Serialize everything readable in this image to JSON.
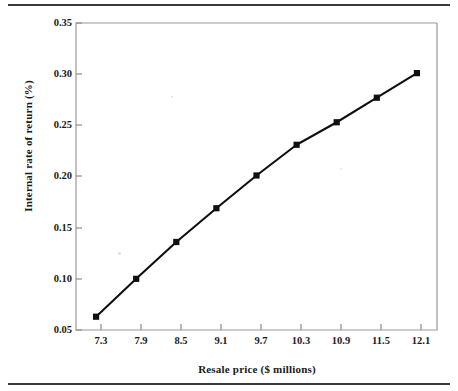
{
  "chart_data": {
    "type": "line",
    "title": "",
    "subtitle": "",
    "xlabel": "Resale price ($ millions)",
    "ylabel": "Internal rate of return (%)",
    "x": [
      7.3,
      7.9,
      8.5,
      9.1,
      9.7,
      10.3,
      10.9,
      11.5,
      12.1
    ],
    "values": [
      0.063,
      0.1,
      0.136,
      0.169,
      0.201,
      0.231,
      0.253,
      0.277,
      0.301
    ],
    "series": [
      {
        "name": "Internal rate of return",
        "values": [
          0.063,
          0.1,
          0.136,
          0.169,
          0.201,
          0.231,
          0.253,
          0.277,
          0.301
        ]
      }
    ],
    "xtick_labels": [
      "7.3",
      "7.9",
      "8.5",
      "9.1",
      "9.7",
      "10.3",
      "10.9",
      "11.5",
      "12.1"
    ],
    "ytick_labels": [
      "0.05",
      "0.10",
      "0.15",
      "0.20",
      "0.25",
      "0.30",
      "0.35"
    ],
    "ytick_values": [
      0.05,
      0.1,
      0.15,
      0.2,
      0.25,
      0.3,
      0.35
    ],
    "ylim": [
      0.05,
      0.35
    ],
    "xlim": [
      7.0,
      12.4
    ],
    "grid": false,
    "legend": "none",
    "marker": "square",
    "marker_color": "#101010",
    "line_color": "#101010",
    "axis_color": "#8c8c8c",
    "background_color": "#ffffff",
    "annotations": []
  },
  "axis_titles": {
    "x": "Resale price ($ millions)",
    "y": "Internal rate of return (%)"
  },
  "ytick_labels": {
    "t0": "0.35",
    "t1": "0.30",
    "t2": "0.25",
    "t3": "0.20",
    "t4": "0.15",
    "t5": "0.10",
    "t6": "0.05"
  },
  "xtick_labels": {
    "t0": "7.3",
    "t1": "7.9",
    "t2": "8.5",
    "t3": "9.1",
    "t4": "9.7",
    "t5": "10.3",
    "t6": "10.9",
    "t7": "11.5",
    "t8": "12.1"
  }
}
